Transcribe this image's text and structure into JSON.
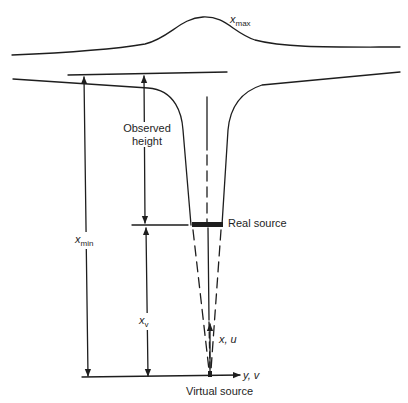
{
  "diagram": {
    "colors": {
      "stroke": "#1e1e1e",
      "background": "#ffffff"
    },
    "labels": {
      "x_max": {
        "base": "x",
        "sub": "max"
      },
      "x_min": {
        "base": "x",
        "sub": "min"
      },
      "x_v": {
        "base": "x",
        "sub": "v"
      },
      "observed_height_line1": "Observed",
      "observed_height_line2": "height",
      "real_source": "Real source",
      "virtual_source": "Virtual source",
      "axis_x_u": "x, u",
      "axis_y_v": "y, v"
    },
    "elements": [
      "x_max-curve",
      "plume-boundary-left",
      "plume-boundary-right",
      "top-reference-line",
      "x_min-dimension-arrow",
      "observed-height-dimension-arrow",
      "x_v-dimension-arrow",
      "real-source-bar",
      "centreline",
      "virtual-cone-dashed-lines",
      "baseline-y-axis",
      "x-axis-arrow"
    ]
  }
}
